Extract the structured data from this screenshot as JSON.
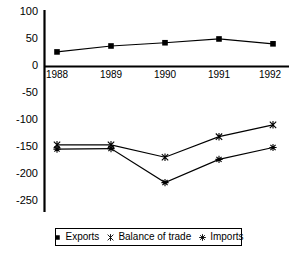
{
  "chart_data": {
    "type": "line",
    "title": "",
    "subtitle": "",
    "xlabel": "",
    "ylabel": "",
    "categories": [
      "1988",
      "1989",
      "1990",
      "1991",
      "1992"
    ],
    "ylim": [
      -250,
      100
    ],
    "yticks": [
      100,
      50,
      0,
      -50,
      -100,
      -150,
      -200,
      -250
    ],
    "ytick_labels": [
      "100",
      "50",
      "0",
      "-50",
      "-100",
      "-150",
      "-200",
      "-250"
    ],
    "grid": false,
    "legend_position": "bottom",
    "series": [
      {
        "name": "Exports",
        "marker": "square",
        "color": "#000000",
        "values": [
          27,
          38,
          44,
          51,
          42
        ]
      },
      {
        "name": "Balance of trade",
        "marker": "cross-x",
        "color": "#000000",
        "values": [
          -145,
          -145,
          -168,
          -130,
          -108
        ]
      },
      {
        "name": "Imports",
        "marker": "plus",
        "color": "#000000",
        "values": [
          -153,
          -152,
          -215,
          -172,
          -150
        ]
      }
    ]
  },
  "axis": {
    "ytick_0": "100",
    "ytick_1": "50",
    "ytick_2": "0",
    "ytick_3": "-50",
    "ytick_4": "-100",
    "ytick_5": "-150",
    "ytick_6": "-200",
    "ytick_7": "-250",
    "xtick_0": "1988",
    "xtick_1": "1989",
    "xtick_2": "1990",
    "xtick_3": "1991",
    "xtick_4": "1992"
  },
  "legend": {
    "entry_0": "Exports",
    "entry_1": "Balance of trade",
    "entry_2": "Imports"
  }
}
